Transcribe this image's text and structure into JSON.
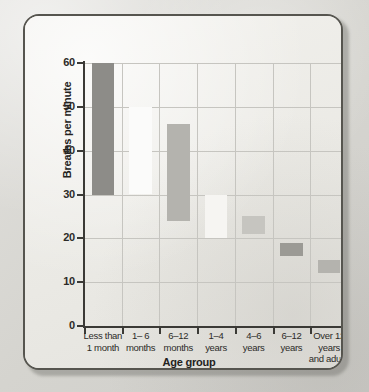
{
  "figure": {
    "frame_border_color": "#56554f",
    "plot_background": "#efeeea",
    "grid_color": "#c6c5c0"
  },
  "chart_data": {
    "type": "bar",
    "subtype": "floating-range-bar",
    "title": "",
    "xlabel": "Age group",
    "ylabel": "Breaths per minute",
    "ylim": [
      0,
      60
    ],
    "yticks": [
      0,
      10,
      20,
      30,
      40,
      50,
      60
    ],
    "ytick_labels": [
      "0",
      "10",
      "20",
      "30",
      "40",
      "50",
      "60"
    ],
    "grid": true,
    "legend": "none",
    "categories": [
      "Less than 1 month",
      "1– 6 months",
      "6–12 months",
      "1–4 years",
      "4–6 years",
      "6–12 years",
      "Over 12 years and adults"
    ],
    "category_lines": [
      [
        "Less than",
        "1 month"
      ],
      [
        "1– 6",
        "months"
      ],
      [
        "6–12",
        "months"
      ],
      [
        "1–4",
        "years"
      ],
      [
        "4–6",
        "years"
      ],
      [
        "6–12",
        "years"
      ],
      [
        "Over 12",
        "years",
        "and adults"
      ]
    ],
    "bars": [
      {
        "category": "Less than 1 month",
        "low": 30,
        "high": 60,
        "color": "#8d8c88"
      },
      {
        "category": "1– 6 months",
        "low": 30,
        "high": 50,
        "color": "#fbfbfa"
      },
      {
        "category": "6–12 months",
        "low": 24,
        "high": 46,
        "color": "#b4b3ae"
      },
      {
        "category": "1–4 years",
        "low": 20,
        "high": 30,
        "color": "#f6f5f2"
      },
      {
        "category": "4–6 years",
        "low": 21,
        "high": 25,
        "color": "#c6c5c0"
      },
      {
        "category": "6–12 years",
        "low": 16,
        "high": 19,
        "color": "#9b9a95"
      },
      {
        "category": "Over 12 years and adults",
        "low": 12,
        "high": 15,
        "color": "#b4b3ae"
      }
    ],
    "values": [
      60,
      50,
      46,
      30,
      25,
      19,
      15
    ],
    "lows": [
      30,
      30,
      24,
      20,
      21,
      16,
      12
    ]
  }
}
